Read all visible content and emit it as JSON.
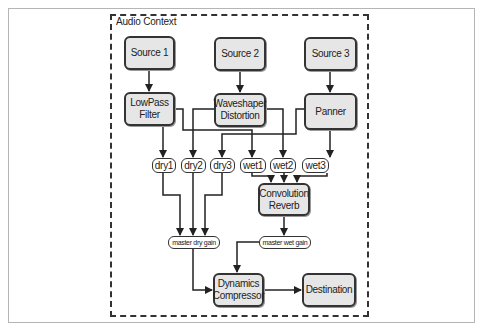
{
  "context_label": "Audio Context",
  "nodes": {
    "source1": "Source 1",
    "source2": "Source 2",
    "source3": "Source 3",
    "lowpass": "LowPass\nFilter",
    "waveshaper": "Waveshaper\nDistortion",
    "panner": "Panner",
    "dry1": "dry1",
    "dry2": "dry2",
    "dry3": "dry3",
    "wet1": "wet1",
    "wet2": "wet2",
    "wet3": "wet3",
    "reverb": "Convolution\nReverb",
    "master_dry": "master dry gain",
    "master_wet": "master wet gain",
    "compressor": "Dynamics\nCompressor",
    "destination": "Destination"
  },
  "edges": [
    [
      "Source 1",
      "LowPass Filter"
    ],
    [
      "Source 2",
      "Waveshaper Distortion"
    ],
    [
      "Source 3",
      "Panner"
    ],
    [
      "LowPass Filter",
      "dry1"
    ],
    [
      "LowPass Filter",
      "wet1"
    ],
    [
      "Waveshaper Distortion",
      "dry2"
    ],
    [
      "Waveshaper Distortion",
      "wet2"
    ],
    [
      "Panner",
      "dry3"
    ],
    [
      "Panner",
      "wet3"
    ],
    [
      "wet1",
      "Convolution Reverb"
    ],
    [
      "wet2",
      "Convolution Reverb"
    ],
    [
      "wet3",
      "Convolution Reverb"
    ],
    [
      "dry1",
      "master dry gain"
    ],
    [
      "dry2",
      "master dry gain"
    ],
    [
      "dry3",
      "master dry gain"
    ],
    [
      "Convolution Reverb",
      "master wet gain"
    ],
    [
      "master dry gain",
      "Dynamics Compressor"
    ],
    [
      "master wet gain",
      "Dynamics Compressor"
    ],
    [
      "Dynamics Compressor",
      "Destination"
    ]
  ],
  "colors": {
    "node_fill": "#e6e6e6",
    "stroke": "#333333",
    "pill_fill": "#ffffff"
  }
}
